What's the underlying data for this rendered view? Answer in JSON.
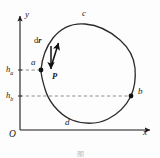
{
  "figure": {
    "type": "line-integral-closed-path-diagram",
    "background_color": "#fdfdfd",
    "ink_color": "#1a1a1a",
    "curve_color": "#2b2b2b",
    "dash_color": "#8c8c8c"
  },
  "axes": {
    "x_label": "x",
    "y_label": "y",
    "origin_label": "O",
    "x_axis": {
      "x1": 20,
      "y1": 130,
      "x2": 152,
      "y2": 130
    },
    "y_axis": {
      "x1": 20,
      "y1": 130,
      "x2": 20,
      "y2": 14
    }
  },
  "gridlines": [
    {
      "name": "h-a-dashed",
      "label": "h",
      "subscript": "a",
      "y": 70,
      "x_start": 20,
      "x_end": 41
    },
    {
      "name": "h-b-dashed",
      "label": "h",
      "subscript": "b",
      "y": 96,
      "x_start": 20,
      "x_end": 131
    }
  ],
  "points": [
    {
      "id": "a",
      "label": "a",
      "x": 41,
      "y": 70,
      "marker": true,
      "label_x": 31,
      "label_y": 62
    },
    {
      "id": "b",
      "label": "b",
      "x": 131,
      "y": 96,
      "marker": true,
      "label_x": 137,
      "label_y": 89
    },
    {
      "id": "c",
      "label": "c",
      "x": 85,
      "y": 24,
      "marker": false,
      "label_x": 83,
      "label_y": 12
    },
    {
      "id": "d",
      "label": "d",
      "x": 67,
      "y": 120,
      "marker": false,
      "label_x": 66,
      "label_y": 120
    }
  ],
  "vectors": [
    {
      "id": "dr",
      "label_upright": "d",
      "label_bold": "r",
      "label_x": 37,
      "label_y": 37,
      "tail_x": 51,
      "tail_y": 67,
      "tip_x": 59,
      "tip_y": 41,
      "description": "differential displacement tangent to path at a"
    },
    {
      "id": "P",
      "label": "P",
      "label_x": 52,
      "label_y": 76,
      "tail_x": 51,
      "tail_y": 46,
      "tip_x": 51,
      "tip_y": 72,
      "description": "force vector pointing downward"
    }
  ],
  "path": {
    "name": "closed-loop",
    "closed": true,
    "d": "M 41 70 C 42 58 46 47 53 38 C 61 28 72 23 85 24 C 97 25 110 31 120 40 C 129 48 134 57 135 68 C 136 79 134 89 131 96 C 127 104 120 113 108 119 C 96 125 82 124 72 120 C 64 117 59 112 54 106 C 50 101 47 96 45 89 C 43 82 41 76 41 70 Z",
    "stroke_width": 1.3
  },
  "caption": {
    "text": "图",
    "y": 148
  }
}
